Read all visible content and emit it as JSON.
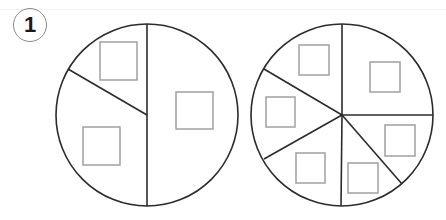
{
  "problem": {
    "number": "1"
  },
  "figures": [
    {
      "name": "circle-divided-3",
      "sections": 3,
      "answer_boxes": 3
    },
    {
      "name": "circle-divided-6",
      "sections": 6,
      "answer_boxes": 6
    }
  ],
  "colors": {
    "outline": "#2b2b2b",
    "box": "#a0a0a0",
    "badge_border": "#8a8a8a"
  }
}
